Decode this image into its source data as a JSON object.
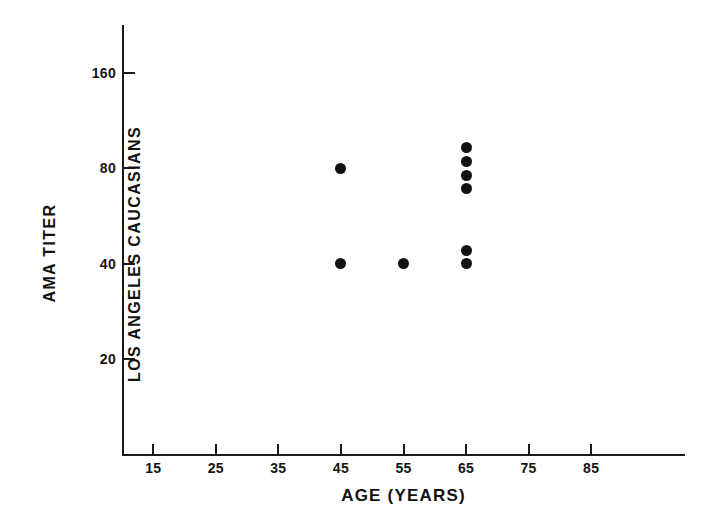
{
  "chart_data": {
    "type": "scatter",
    "title": "",
    "xlabel": "AGE (YEARS)",
    "ylabel_line1": "AMA TITER",
    "ylabel_line2": "LOS ANGELES CAUCASIANS",
    "x_ticks": [
      15,
      25,
      35,
      45,
      55,
      65,
      75,
      85
    ],
    "x_tick_labels": [
      "15",
      "25",
      "35",
      "45",
      "55",
      "65",
      "75",
      "85"
    ],
    "y_ticks": [
      20,
      40,
      80,
      160
    ],
    "y_tick_labels": [
      "20",
      "40",
      "80",
      "160"
    ],
    "y_scale": "log2",
    "xlim": [
      10,
      100
    ],
    "ylim": [
      10,
      226
    ],
    "grid": false,
    "legend": null,
    "marker": "filled-circle",
    "marker_color": "#111111",
    "points": [
      {
        "x": 45,
        "y": 80
      },
      {
        "x": 45,
        "y": 40
      },
      {
        "x": 55,
        "y": 40
      },
      {
        "x": 65,
        "y": 93
      },
      {
        "x": 65,
        "y": 84
      },
      {
        "x": 65,
        "y": 76
      },
      {
        "x": 65,
        "y": 69
      },
      {
        "x": 65,
        "y": 44
      },
      {
        "x": 65,
        "y": 40
      }
    ]
  },
  "axes": {
    "x_axis_name": "age-axis",
    "y_axis_name": "ama-titer-axis"
  }
}
